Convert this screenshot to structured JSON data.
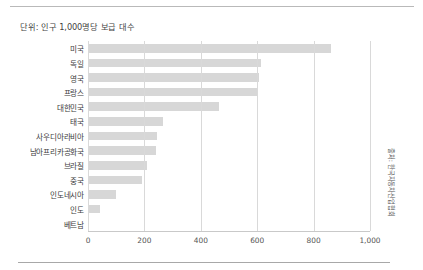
{
  "figure": {
    "subtitle": "단위: 인구 1,000명당 보급 대수",
    "source": "출처: 한국자동차산업협회"
  },
  "chart_data": {
    "type": "bar",
    "orientation": "horizontal",
    "title": "",
    "subtitle": "단위: 인구 1,000명당 보급 대수",
    "xlabel": "",
    "ylabel": "",
    "xlim": [
      0,
      1000
    ],
    "grid": true,
    "legend": false,
    "bar_color": "#d7d7d7",
    "xticks": [
      0,
      200,
      400,
      600,
      800,
      1000
    ],
    "xtick_labels": [
      "0",
      "200",
      "400",
      "600",
      "800",
      "1,000"
    ],
    "categories": [
      "미국",
      "독일",
      "영국",
      "프랑스",
      "대한민국",
      "태국",
      "사우디아라비아",
      "남아프리카공화국",
      "브라질",
      "중국",
      "인도네시아",
      "인도",
      "베트남"
    ],
    "values": [
      862,
      615,
      605,
      600,
      465,
      266,
      245,
      241,
      210,
      192,
      100,
      42,
      5
    ],
    "annotations": [
      "출처: 한국자동차산업협회"
    ]
  }
}
